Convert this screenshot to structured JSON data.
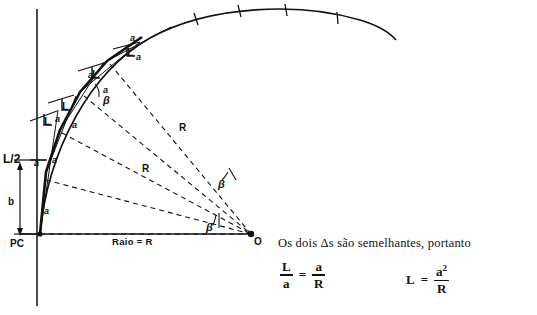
{
  "figure": {
    "type": "geometry-diagram",
    "points": {
      "pc_label": "PC",
      "center_label": "O"
    },
    "axis_labels": {
      "half_chord": "L/2",
      "offset_b": "b",
      "baseline": "Raio = R"
    },
    "chord_labels": [
      "a",
      "a",
      "a",
      "a",
      "a",
      "a",
      "a",
      "a"
    ],
    "offset_labels": [
      "L",
      "L",
      "L",
      "L"
    ],
    "radius_labels": [
      "R",
      "R"
    ],
    "angle_labels": [
      "β",
      "β",
      "β"
    ]
  },
  "notes": {
    "sentence": "Os dois Δs são semelhantes, portanto"
  },
  "equations": {
    "eq1": {
      "left_num": "L",
      "left_den": "a",
      "symbol": "=",
      "right_num": "a",
      "right_den": "R"
    },
    "eq2": {
      "left": "L",
      "symbol": "=",
      "right_num": "a",
      "right_num_sup": "2",
      "right_den": "R"
    }
  },
  "colors": {
    "ink": "#111111",
    "background": "#ffffff"
  }
}
